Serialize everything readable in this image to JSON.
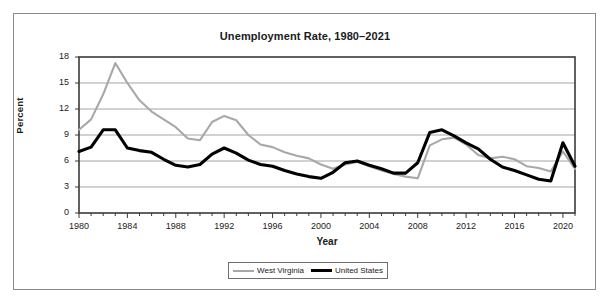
{
  "chart_data": {
    "type": "line",
    "title": "Unemployment Rate, 1980–2021",
    "xlabel": "Year",
    "ylabel": "Percent",
    "xlim": [
      1980,
      2021
    ],
    "ylim": [
      0,
      18
    ],
    "yticks": [
      0,
      3,
      6,
      9,
      12,
      15,
      18
    ],
    "xticks": [
      1980,
      1984,
      1988,
      1992,
      1996,
      2000,
      2004,
      2008,
      2012,
      2016,
      2020
    ],
    "grid": "horizontal",
    "legend_position": "bottom-center",
    "x": [
      1980,
      1981,
      1982,
      1983,
      1984,
      1985,
      1986,
      1987,
      1988,
      1989,
      1990,
      1991,
      1992,
      1993,
      1994,
      1995,
      1996,
      1997,
      1998,
      1999,
      2000,
      2001,
      2002,
      2003,
      2004,
      2005,
      2006,
      2007,
      2008,
      2009,
      2010,
      2011,
      2012,
      2013,
      2014,
      2015,
      2016,
      2017,
      2018,
      2019,
      2020,
      2021
    ],
    "series": [
      {
        "name": "West Virginia",
        "color": "#a8a8a8",
        "width": 2.1,
        "values": [
          9.6,
          10.8,
          13.7,
          17.3,
          15.0,
          13.0,
          11.7,
          10.8,
          9.9,
          8.6,
          8.4,
          10.5,
          11.2,
          10.7,
          9.0,
          7.9,
          7.6,
          7.0,
          6.6,
          6.3,
          5.6,
          5.1,
          5.6,
          5.9,
          5.4,
          4.9,
          4.5,
          4.2,
          4.0,
          7.8,
          8.5,
          8.7,
          7.9,
          6.7,
          6.3,
          6.5,
          6.2,
          5.4,
          5.2,
          4.8,
          7.1,
          5.1
        ]
      },
      {
        "name": "United States",
        "color": "#000000",
        "width": 3.1,
        "values": [
          7.1,
          7.6,
          9.6,
          9.6,
          7.5,
          7.2,
          7.0,
          6.2,
          5.5,
          5.3,
          5.6,
          6.8,
          7.5,
          6.9,
          6.1,
          5.6,
          5.4,
          4.9,
          4.5,
          4.2,
          4.0,
          4.7,
          5.8,
          6.0,
          5.5,
          5.1,
          4.6,
          4.6,
          5.8,
          9.3,
          9.6,
          8.9,
          8.1,
          7.4,
          6.2,
          5.3,
          4.9,
          4.4,
          3.9,
          3.7,
          8.1,
          5.4
        ]
      }
    ]
  },
  "legend": {
    "items": [
      {
        "label": "West Virginia"
      },
      {
        "label": "United States"
      }
    ]
  }
}
